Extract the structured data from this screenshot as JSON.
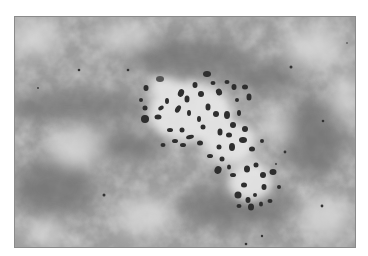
{
  "figure": {
    "colors": {
      "background_mid": "#9a9a9a",
      "background_light": "#d8d8d8",
      "background_dark": "#707070",
      "halo": "#e6e6e6",
      "chromosome": "#2e2e2e",
      "border": "#8a8a8a"
    }
  }
}
